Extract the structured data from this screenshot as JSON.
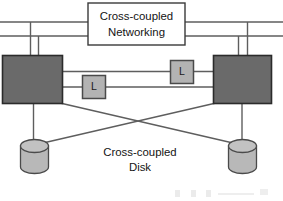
{
  "diagram": {
    "background_color": "#ffffff",
    "line_color": "#5a5a5a",
    "node_fill": "#6a6a6a",
    "node_stroke": "#2b2b2b",
    "link_box_fill": "#b3b3b3",
    "link_box_stroke": "#4a4a4a",
    "disk_fill": "#b8b8b8",
    "disk_stroke": "#4a4a4a",
    "text_color": "#141414"
  },
  "networking_box": {
    "name": "cross-coupled-networking-box",
    "line1": "Cross-coupled",
    "line2": "Networking",
    "fill": "#ffffff",
    "stroke": "#3a3a3a"
  },
  "disk_caption": {
    "name": "cross-coupled-disk-caption",
    "line1": "Cross-coupled",
    "line2": "Disk"
  },
  "nodes": [
    {
      "id": "left-node",
      "label": ""
    },
    {
      "id": "right-node",
      "label": ""
    }
  ],
  "link_boxes": [
    {
      "id": "link-box-lower-left",
      "label": "L"
    },
    {
      "id": "link-box-upper-right",
      "label": "L"
    }
  ],
  "disks": [
    {
      "id": "left-disk",
      "label": ""
    },
    {
      "id": "right-disk",
      "label": ""
    }
  ],
  "network_buses": [
    {
      "id": "network-bus-top",
      "y": 22
    },
    {
      "id": "network-bus-bottom",
      "y": 36
    }
  ]
}
